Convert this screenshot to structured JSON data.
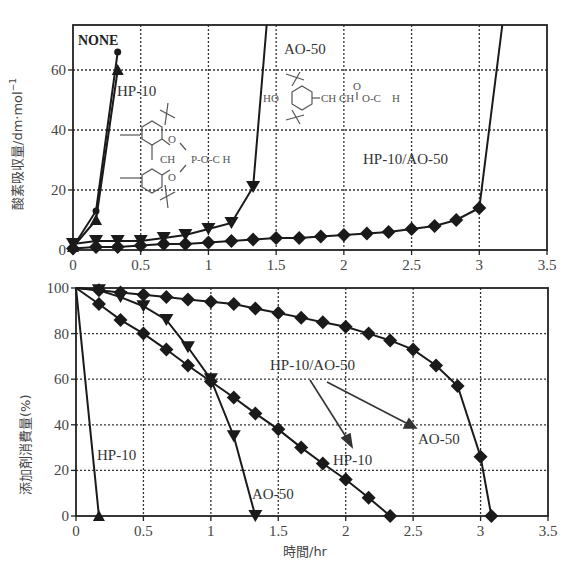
{
  "chart_data": [
    {
      "type": "line",
      "title": "",
      "xlabel": "",
      "ylabel": "酸素吸収量/dm·mol⁻¹",
      "xlim": [
        0,
        3.5
      ],
      "ylim": [
        0,
        75
      ],
      "xticks": [
        "0",
        "0.5",
        "1",
        "1.5",
        "2",
        "2.5",
        "3",
        "3.5"
      ],
      "yticks": [
        "0",
        "20",
        "40",
        "60"
      ],
      "grid": true,
      "series": [
        {
          "name": "NONE",
          "marker": "circle",
          "x": [
            0,
            0.17,
            0.33
          ],
          "y": [
            1,
            13,
            66
          ]
        },
        {
          "name": "HP-10",
          "marker": "triangle-up",
          "x": [
            0,
            0.17,
            0.33
          ],
          "y": [
            1,
            10,
            60
          ]
        },
        {
          "name": "AO-50",
          "marker": "triangle-down",
          "x": [
            0,
            0.17,
            0.33,
            0.5,
            0.67,
            0.83,
            1.0,
            1.17,
            1.33,
            1.43
          ],
          "y": [
            2,
            3,
            3,
            3,
            4,
            5,
            7,
            9,
            21,
            75
          ]
        },
        {
          "name": "HP-10/AO-50",
          "marker": "diamond",
          "x": [
            0,
            0.17,
            0.33,
            0.5,
            0.67,
            0.83,
            1.0,
            1.17,
            1.33,
            1.5,
            1.67,
            1.83,
            2.0,
            2.17,
            2.33,
            2.5,
            2.67,
            2.83,
            3.0,
            3.17
          ],
          "y": [
            0.5,
            1,
            1,
            1.5,
            2,
            2,
            2.5,
            3,
            3.5,
            4,
            4,
            4.5,
            5,
            5.5,
            6,
            7,
            8,
            10,
            14,
            75
          ]
        }
      ],
      "annotations": [
        {
          "text": "NONE",
          "x": 0.05,
          "y": 70
        },
        {
          "text": "HP-10",
          "x": 0.33,
          "y": 54
        },
        {
          "text": "AO-50",
          "x": 1.55,
          "y": 66
        },
        {
          "text": "HP-10/AO-50",
          "x": 2.15,
          "y": 28
        },
        {
          "text": "CH₂ P-O-C H",
          "x": 0.6,
          "y": 32,
          "kind": "structure HP-10"
        },
        {
          "text": "HO- ... -CH₂CH₂-C(=O)-O-C₁₈H₃₇",
          "x": 1.4,
          "y": 50,
          "kind": "structure AO-50"
        }
      ]
    },
    {
      "type": "line",
      "title": "",
      "xlabel": "時間/hr",
      "ylabel": "添加剤消費量(%)",
      "xlim": [
        0,
        3.5
      ],
      "ylim": [
        0,
        100
      ],
      "xticks": [
        "0",
        "0.5",
        "1",
        "1.5",
        "2",
        "2.5",
        "3",
        "3.5"
      ],
      "yticks": [
        "0",
        "20",
        "40",
        "60",
        "80",
        "100"
      ],
      "grid": true,
      "series": [
        {
          "name": "HP-10",
          "marker": "triangle-up",
          "x": [
            0,
            0.17
          ],
          "y": [
            100,
            0
          ]
        },
        {
          "name": "AO-50",
          "marker": "triangle-down",
          "x": [
            0,
            0.17,
            0.33,
            0.5,
            0.67,
            0.83,
            1.0,
            1.17,
            1.33
          ],
          "y": [
            100,
            99,
            96,
            92,
            86,
            74,
            60,
            35,
            0
          ]
        },
        {
          "name": "HP-10/AO-50 (HP-10)",
          "marker": "diamond",
          "x": [
            0,
            0.17,
            0.33,
            0.5,
            0.67,
            0.83,
            1.0,
            1.17,
            1.33,
            1.5,
            1.67,
            1.83,
            2.0,
            2.17,
            2.33
          ],
          "y": [
            100,
            93,
            86,
            80,
            73,
            66,
            59,
            52,
            45,
            38,
            30,
            23,
            16,
            8,
            0
          ]
        },
        {
          "name": "HP-10/AO-50 (AO-50)",
          "marker": "diamond",
          "x": [
            0,
            0.17,
            0.33,
            0.5,
            0.67,
            0.83,
            1.0,
            1.17,
            1.33,
            1.5,
            1.67,
            1.83,
            2.0,
            2.17,
            2.33,
            2.5,
            2.67,
            2.83,
            3.0,
            3.08
          ],
          "y": [
            100,
            99,
            98,
            97,
            96,
            95,
            94,
            93,
            91,
            89,
            87,
            85,
            83,
            80,
            77,
            73,
            66,
            57,
            26,
            0
          ]
        }
      ],
      "annotations": [
        {
          "text": "HP-10",
          "x": 0.15,
          "y": 22
        },
        {
          "text": "AO-50",
          "x": 1.3,
          "y": 8
        },
        {
          "text": "HP-10/AO-50",
          "x": 1.45,
          "y": 64
        },
        {
          "text": "HP-10",
          "x": 1.88,
          "y": 20
        },
        {
          "text": "AO-50",
          "x": 2.55,
          "y": 30
        }
      ]
    }
  ],
  "labels": {
    "top_ylabel": "酸素吸収量/dm·mol",
    "top_ylabel_sup": "−1",
    "bottom_ylabel": "添加剤消費量(%)",
    "xlabel": "時間/hr",
    "none": "NONE",
    "hp10": "HP-10",
    "ao50": "AO-50",
    "mix": "HP-10/AO-50",
    "hp_ch2": "CH",
    "hp_p": "P-O-C H",
    "ao_ho": "HO",
    "ao_chain": "CH CH",
    "ao_ester": "O-C",
    "ao_h": "H",
    "ao_o": "O",
    "hp_o": "O"
  },
  "ticks": {
    "x": [
      "0",
      "0.5",
      "1",
      "1.5",
      "2",
      "2.5",
      "3",
      "3.5"
    ],
    "top_y": [
      "0",
      "20",
      "40",
      "60"
    ],
    "bottom_y": [
      "0",
      "20",
      "40",
      "60",
      "80",
      "100"
    ]
  },
  "colors": {
    "line": "#1a1a1a",
    "grid": "#333333",
    "text": "#333333"
  }
}
